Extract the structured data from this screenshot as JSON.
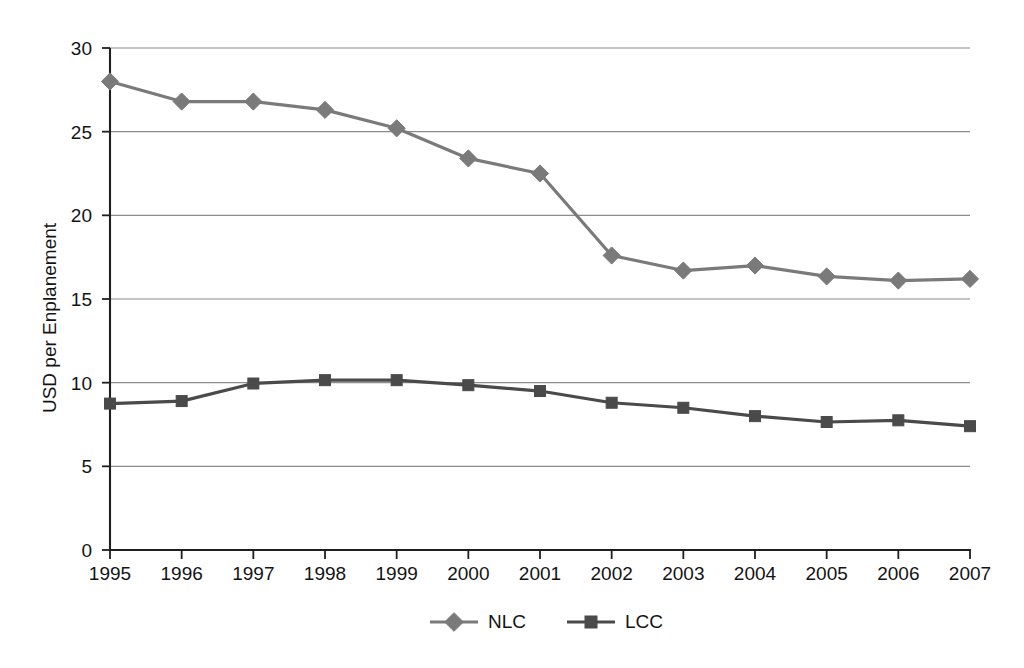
{
  "chart_data": {
    "type": "line",
    "title": "",
    "xlabel": "",
    "ylabel": "USD per Enplanement",
    "categories": [
      "1995",
      "1996",
      "1997",
      "1998",
      "1999",
      "2000",
      "2001",
      "2002",
      "2003",
      "2004",
      "2005",
      "2006",
      "2007"
    ],
    "series": [
      {
        "name": "NLC",
        "marker": "diamond",
        "color": "#7a7a7a",
        "values": [
          28.0,
          26.8,
          26.8,
          26.3,
          25.2,
          23.4,
          22.5,
          17.6,
          16.7,
          17.0,
          16.35,
          16.1,
          16.2
        ]
      },
      {
        "name": "LCC",
        "marker": "square",
        "color": "#4a4a4a",
        "values": [
          8.75,
          8.9,
          9.95,
          10.15,
          10.15,
          9.85,
          9.5,
          8.8,
          8.5,
          8.0,
          7.65,
          7.75,
          7.4
        ]
      }
    ],
    "ylim": [
      0,
      30
    ],
    "yticks": [
      0,
      5,
      10,
      15,
      20,
      25,
      30
    ],
    "ytick_labels": [
      "0",
      "5",
      "10",
      "15",
      "20",
      "25",
      "30"
    ],
    "grid": "horizontal",
    "legend_position": "bottom"
  },
  "axis": {
    "y_title": "USD per Enplanement"
  },
  "legend": {
    "entries": [
      {
        "label": "NLC",
        "marker": "diamond-marker",
        "color": "#7a7a7a"
      },
      {
        "label": "LCC",
        "marker": "square-marker",
        "color": "#4a4a4a"
      }
    ]
  },
  "colors": {
    "nlc": "#7a7a7a",
    "lcc": "#4a4a4a",
    "gridline": "#8c8c8c",
    "axis": "#1f1f1f",
    "background": "#ffffff",
    "text": "#141414"
  }
}
